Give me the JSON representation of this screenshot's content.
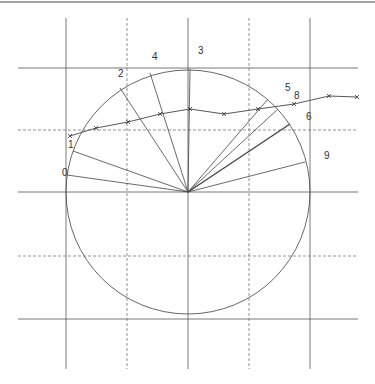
{
  "diagram": {
    "title": "",
    "center": {
      "x": 188,
      "y": 192
    },
    "radius": 122,
    "grid": {
      "solid_verticals": [
        66,
        188,
        310
      ],
      "dashed_verticals": [
        127,
        249
      ],
      "solid_horizontals": [
        68,
        192,
        319
      ],
      "dashed_horizontals": [
        130,
        256
      ],
      "vertical_extent": [
        18,
        369
      ],
      "horizontal_extent": [
        18,
        358
      ],
      "top_rule_y": 2
    },
    "labels": [
      {
        "id": "0",
        "text": "0",
        "x": 62,
        "y": 176
      },
      {
        "id": "1",
        "text": "1",
        "x": 68,
        "y": 148
      },
      {
        "id": "2",
        "text": "2",
        "x": 118,
        "y": 77
      },
      {
        "id": "4",
        "text": "4",
        "x": 152,
        "y": 60
      },
      {
        "id": "3",
        "text": "3",
        "x": 198,
        "y": 54
      },
      {
        "id": "5",
        "text": "5",
        "x": 285,
        "y": 91
      },
      {
        "id": "8",
        "text": "8",
        "x": 294,
        "y": 99
      },
      {
        "id": "6",
        "text": "6",
        "x": 306,
        "y": 120
      },
      {
        "id": "9",
        "text": "9",
        "x": 324,
        "y": 159
      }
    ],
    "radial_endpoints": [
      [
        67,
        175
      ],
      [
        73,
        151
      ],
      [
        120,
        88
      ],
      [
        150,
        73
      ],
      [
        190,
        69
      ],
      [
        268,
        99
      ],
      [
        278,
        109
      ],
      [
        290,
        124
      ],
      [
        305,
        162
      ]
    ],
    "curve_points": [
      [
        70,
        136
      ],
      [
        96,
        128
      ],
      [
        128,
        122
      ],
      [
        160,
        114
      ],
      [
        190,
        109
      ],
      [
        224,
        114
      ],
      [
        258,
        109
      ],
      [
        294,
        104
      ],
      [
        329,
        96
      ],
      [
        357,
        97
      ]
    ]
  }
}
